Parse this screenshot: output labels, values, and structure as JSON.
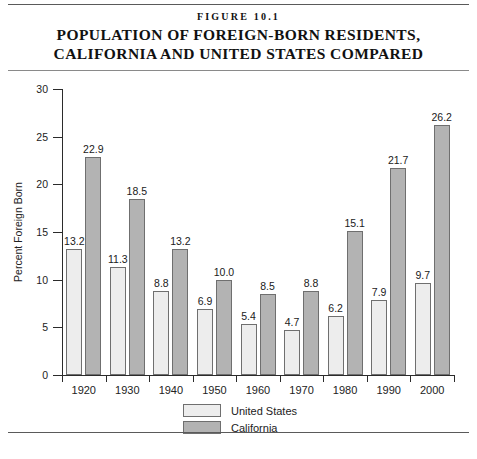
{
  "figure": {
    "number_label": "FIGURE 10.1",
    "title_line_1": "POPULATION OF FOREIGN-BORN RESIDENTS,",
    "title_line_2": "CALIFORNIA AND UNITED STATES COMPARED"
  },
  "colors": {
    "united_states_bar": "#ededed",
    "california_bar": "#b3b3b3",
    "bar_border": "#6f6f6f",
    "axis": "#2b2b2b",
    "rule": "#5a5a5a",
    "background": "#ffffff"
  },
  "legend": {
    "position": "below-chart",
    "entries": [
      {
        "label": "United States",
        "color": "#ededed"
      },
      {
        "label": "California",
        "color": "#b3b3b3"
      }
    ]
  },
  "axes": {
    "y_title": "Percent Foreign Born",
    "y_ticks": [
      "0",
      "5",
      "10",
      "15",
      "20",
      "25",
      "30"
    ],
    "x_ticks": [
      "1920",
      "1930",
      "1940",
      "1950",
      "1960",
      "1970",
      "1980",
      "1990",
      "2000"
    ]
  },
  "chart_data": {
    "type": "bar",
    "xlabel": "",
    "ylabel": "Percent Foreign Born",
    "ylim": [
      0,
      30
    ],
    "ytick_step": 5,
    "grid": false,
    "legend_position": "bottom",
    "categories": [
      "1920",
      "1930",
      "1940",
      "1950",
      "1960",
      "1970",
      "1980",
      "1990",
      "2000"
    ],
    "series": [
      {
        "name": "United States",
        "color": "#ededed",
        "values": [
          13.2,
          11.3,
          8.8,
          6.9,
          5.4,
          4.7,
          6.2,
          7.9,
          9.7
        ],
        "labels": [
          "13.2",
          "11.3",
          "8.8",
          "6.9",
          "5.4",
          "4.7",
          "6.2",
          "7.9",
          "9.7"
        ]
      },
      {
        "name": "California",
        "color": "#b3b3b3",
        "values": [
          22.9,
          18.5,
          13.2,
          10.0,
          8.5,
          8.8,
          15.1,
          21.7,
          26.2
        ],
        "labels": [
          "22.9",
          "18.5",
          "13.2",
          "10.0",
          "8.5",
          "8.8",
          "15.1",
          "21.7",
          "26.2"
        ]
      }
    ]
  }
}
